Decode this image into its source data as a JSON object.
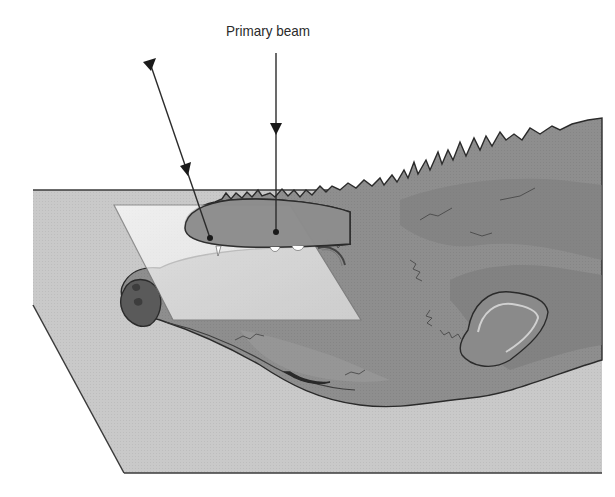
{
  "diagram": {
    "title_label": "Primary beam",
    "elements": {
      "table": "x-ray-table-surface",
      "cassette": "radiographic-plate",
      "beams": [
        {
          "name": "primary-beam",
          "direction": "vertical",
          "target": "nasal-region"
        },
        {
          "name": "oblique-beam",
          "direction": "angled",
          "target": "rostral-maxilla"
        }
      ]
    },
    "colors": {
      "table": "#c9c9c9",
      "table_edge": "#3a3a3a",
      "fur_base": "#8e8e8e",
      "fur_dark": "#7a7a7a",
      "fur_light": "#a4a4a4",
      "plate": "#f2f2f2",
      "outline": "#2b2b2b",
      "nose": "#5a5a5a"
    }
  }
}
